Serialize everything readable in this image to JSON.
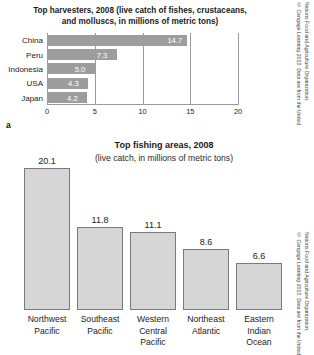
{
  "panel_a": {
    "letter": "a",
    "title": "Top harvesters, 2008 (live catch of fishes, crustaceans, and molluscs, in millions of metric tons)",
    "credit_line_1": "© Cengage Learning 2013. Data are from the United",
    "credit_line_2": "Nations Food and Agriculture Organization."
  },
  "panel_b": {
    "title": "Top fishing areas, 2008",
    "subtitle": "(live catch, in millions of metric tons)",
    "credit_line_1": "© Cengage Learning 2013. Data are from the United",
    "credit_line_2": "Nations Food and Agriculture Organization."
  },
  "colors": {
    "bar_fill_a": "#9d9d9d",
    "bar_fill_b": "#d6d6d6",
    "bar_stroke_b": "#7a7a7a",
    "axis": "#9a9a9a",
    "text": "#1b1b1b"
  },
  "chart_data": [
    {
      "type": "bar",
      "orientation": "horizontal",
      "title": "Top harvesters, 2008 (live catch of fishes, crustaceans, and molluscs, in millions of metric tons)",
      "xlabel": "",
      "ylabel": "",
      "xlim": [
        0,
        20
      ],
      "xticks": [
        0,
        5,
        10,
        15,
        20
      ],
      "xtick_labels": [
        "0",
        "5",
        "10",
        "15",
        "20"
      ],
      "grid": true,
      "legend": false,
      "categories": [
        "China",
        "Peru",
        "Indonesia",
        "USA",
        "Japan"
      ],
      "values": [
        14.7,
        7.3,
        5.0,
        4.3,
        4.2
      ],
      "value_labels": [
        "14.7",
        "7.3",
        "5.0",
        "4.3",
        "4.2"
      ]
    },
    {
      "type": "bar",
      "orientation": "vertical",
      "title": "Top fishing areas, 2008",
      "subtitle": "(live catch, in millions of metric tons)",
      "xlabel": "",
      "ylabel": "",
      "ylim": [
        0,
        20.1
      ],
      "grid": false,
      "legend": false,
      "categories": [
        "Northwest Pacific",
        "Southeast Pacific",
        "Western Central Pacific",
        "Northeast Atlantic",
        "Eastern Indian Ocean"
      ],
      "category_lines": [
        [
          "Northwest",
          "Pacific"
        ],
        [
          "Southeast",
          "Pacific"
        ],
        [
          "Western",
          "Central",
          "Pacific"
        ],
        [
          "Northeast",
          "Atlantic"
        ],
        [
          "Eastern",
          "Indian",
          "Ocean"
        ]
      ],
      "values": [
        20.1,
        11.8,
        11.1,
        8.6,
        6.6
      ],
      "value_labels": [
        "20.1",
        "11.8",
        "11.1",
        "8.6",
        "6.6"
      ]
    }
  ]
}
